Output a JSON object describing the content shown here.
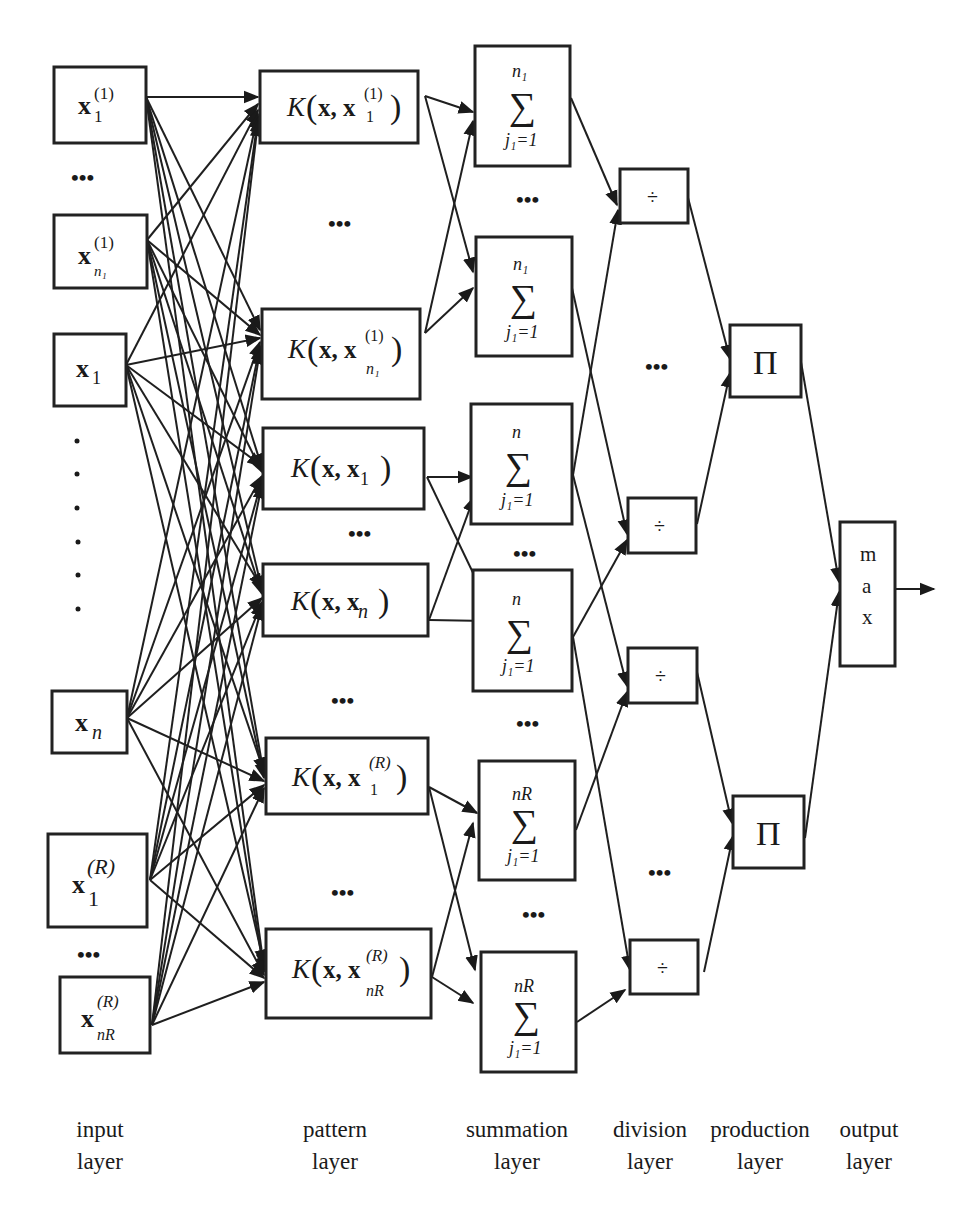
{
  "diagram": {
    "type": "neural-network-architecture",
    "layers": [
      {
        "id": "input",
        "caption_line1": "input",
        "caption_line2": "layer"
      },
      {
        "id": "pattern",
        "caption_line1": "pattern",
        "caption_line2": "layer"
      },
      {
        "id": "summation",
        "caption_line1": "summation",
        "caption_line2": "layer"
      },
      {
        "id": "division",
        "caption_line1": "division",
        "caption_line2": "layer"
      },
      {
        "id": "production",
        "caption_line1": "production",
        "caption_line2": "layer"
      },
      {
        "id": "output",
        "caption_line1": "output",
        "caption_line2": "layer"
      }
    ],
    "input_nodes": [
      {
        "base": "x",
        "sub": "1",
        "sup": "(1)"
      },
      {
        "base": "x",
        "sub": "n₁",
        "sup": "(1)"
      },
      {
        "base": "x",
        "sub": "1",
        "sup": ""
      },
      {
        "base": "x",
        "sub": "n",
        "sup": ""
      },
      {
        "base": "x",
        "sub": "1",
        "sup": "(R)"
      },
      {
        "base": "x",
        "sub": "nR",
        "sup": "(R)"
      }
    ],
    "pattern_nodes": [
      {
        "func": "K",
        "arg": "x, x",
        "sub": "1",
        "sup": "(1)"
      },
      {
        "func": "K",
        "arg": "x, x",
        "sub": "n₁",
        "sup": "(1)"
      },
      {
        "func": "K",
        "arg": "x, x",
        "sub": "1",
        "sup": ""
      },
      {
        "func": "K",
        "arg": "x, x",
        "sub": "n",
        "sup": ""
      },
      {
        "func": "K",
        "arg": "x, x",
        "sub": "1",
        "sup": "(R)"
      },
      {
        "func": "K",
        "arg": "x, x",
        "sub": "nR",
        "sup": "(R)"
      }
    ],
    "summation_nodes": [
      {
        "symbol": "∑",
        "upper": "n₁",
        "lower": "j₁=1"
      },
      {
        "symbol": "∑",
        "upper": "n₁",
        "lower": "j₁=1"
      },
      {
        "symbol": "∑",
        "upper": "n",
        "lower": "j₁=1"
      },
      {
        "symbol": "∑",
        "upper": "n",
        "lower": "j₁=1"
      },
      {
        "symbol": "∑",
        "upper": "nR",
        "lower": "j₁=1"
      },
      {
        "symbol": "∑",
        "upper": "nR",
        "lower": "j₁=1"
      }
    ],
    "division_nodes": [
      {
        "symbol": "÷"
      },
      {
        "symbol": "÷"
      },
      {
        "symbol": "÷"
      },
      {
        "symbol": "÷"
      }
    ],
    "production_nodes": [
      {
        "symbol": "Π"
      },
      {
        "symbol": "Π"
      }
    ],
    "output_node": {
      "letters": [
        "m",
        "a",
        "x"
      ]
    },
    "ellipsis": "•••",
    "vertical_dots": "•"
  }
}
